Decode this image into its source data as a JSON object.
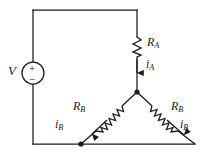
{
  "figure": {
    "background_color": "#ffffff",
    "line_color": "#1a1a1a"
  },
  "labels": {
    "source": {
      "symbol": "V",
      "subscript": ""
    },
    "resistor_a": {
      "symbol": "R",
      "subscript": "A"
    },
    "current_a": {
      "symbol": "i",
      "subscript": "A"
    },
    "resistor_b_left": {
      "symbol": "R",
      "subscript": "B"
    },
    "resistor_b_right": {
      "symbol": "R",
      "subscript": "B"
    },
    "current_b_left": {
      "symbol": "i",
      "subscript": "B"
    },
    "current_b_right": {
      "symbol": "i",
      "subscript": "B"
    }
  },
  "source_polarity": {
    "plus": "+",
    "minus": "−"
  }
}
